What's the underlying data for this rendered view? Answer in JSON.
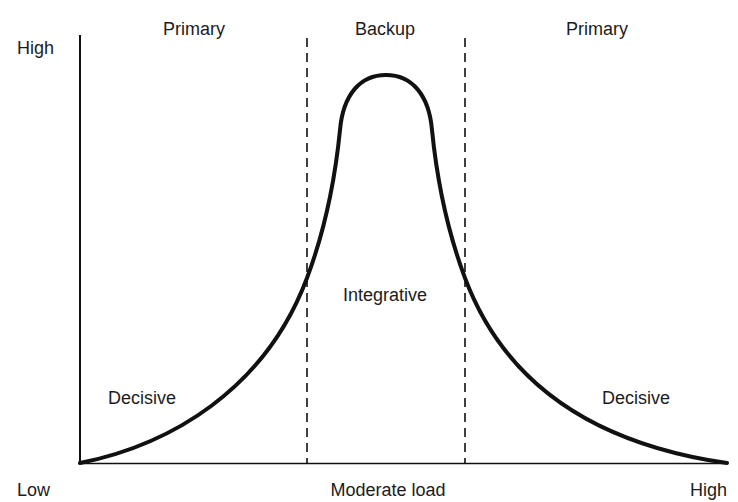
{
  "diagram": {
    "y_axis": {
      "high_label": "High"
    },
    "x_axis": {
      "low_label": "Low",
      "mid_label": "Moderate load",
      "high_label": "High"
    },
    "regions": {
      "left_top": "Primary",
      "center_top": "Backup",
      "right_top": "Primary",
      "center_mid": "Integrative",
      "left_low": "Decisive",
      "right_low": "Decisive"
    },
    "colors": {
      "line": "#111111",
      "background": "#ffffff"
    }
  }
}
